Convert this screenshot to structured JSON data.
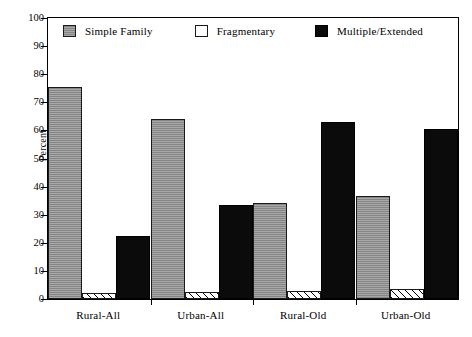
{
  "chart_data": {
    "type": "bar",
    "title": "",
    "xlabel": "",
    "ylabel": "Percent",
    "ylim": [
      0,
      100
    ],
    "ytick_step": 10,
    "yticks": [
      0,
      10,
      20,
      30,
      40,
      50,
      60,
      70,
      80,
      90,
      100
    ],
    "grid": false,
    "legend_position": "top-left-inside",
    "categories": [
      "Rural-All",
      "Urban-All",
      "Rural-Old",
      "Urban-Old"
    ],
    "series": [
      {
        "name": "Simple Family",
        "color": "#9e9e9e",
        "pattern": "solid-gray",
        "values": [
          75.5,
          64.0,
          34.0,
          36.5
        ]
      },
      {
        "name": "Fragmentary",
        "color": "#ffffff",
        "pattern": "diagonal-hatch",
        "values": [
          2.0,
          2.5,
          3.0,
          3.5
        ]
      },
      {
        "name": "Multiple/Extended",
        "color": "#0b0b0b",
        "pattern": "solid-black",
        "values": [
          22.5,
          33.5,
          63.0,
          60.5
        ]
      }
    ]
  },
  "legend": {
    "items": [
      {
        "label": "Simple Family",
        "swatch": "simple"
      },
      {
        "label": "Fragmentary",
        "swatch": "fragmentary"
      },
      {
        "label": "Multiple/Extended",
        "swatch": "multiple"
      }
    ]
  },
  "axes": {
    "y_title": "Percent"
  }
}
